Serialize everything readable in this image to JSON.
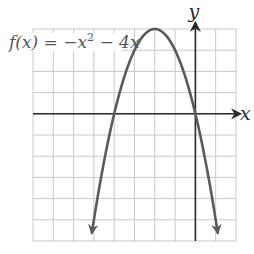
{
  "chart_data": {
    "type": "line",
    "title": "",
    "function_label": {
      "prefix": "f(x) = −x",
      "exponent": "2",
      "suffix": " − 4x"
    },
    "xlabel": "x",
    "ylabel": "y",
    "xlim": [
      -8,
      2
    ],
    "ylim": [
      -6,
      4
    ],
    "grid": true,
    "grid_step": 1,
    "series": [
      {
        "name": "f(x) = -x^2 - 4x",
        "expression": "-x^2 - 4x",
        "domain": [
          -5.1,
          1.1
        ],
        "x": [
          -5.1,
          -5,
          -4.5,
          -4,
          -3.5,
          -3,
          -2.5,
          -2,
          -1.5,
          -1,
          -0.5,
          0,
          0.5,
          1,
          1.1
        ],
        "values": [
          -5.61,
          -5,
          -2.25,
          0,
          1.75,
          3,
          3.75,
          4,
          3.75,
          3,
          1.75,
          0,
          -2.25,
          -5,
          -5.61
        ],
        "arrows": "both-ends"
      }
    ],
    "key_points": {
      "vertex": [
        -2,
        4
      ],
      "x_intercepts": [
        -4,
        0
      ]
    },
    "colors": {
      "curve": "#5a5a5a",
      "axes": "#2a2a2a",
      "grid": "#c8c8c8"
    }
  }
}
